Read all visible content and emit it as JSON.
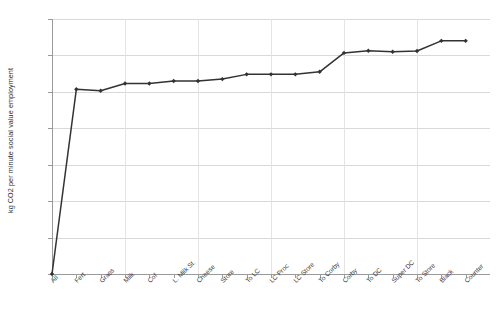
{
  "chart_data": {
    "type": "line",
    "title": "",
    "xlabel": "",
    "ylabel": "kg CO2 per minute social value employment",
    "ylim": [
      0,
      70
    ],
    "yticks": [
      0,
      10,
      20,
      30,
      40,
      50,
      60,
      70
    ],
    "grid": true,
    "legend": "none",
    "marker": "diamond",
    "line_color": "#333333",
    "marker_color": "#333333",
    "categories": [
      "All",
      "Fert",
      "Grass",
      "Milk",
      "Cof",
      "L. Milk St.",
      "Cheese",
      "Store",
      "To LC",
      "LC Proc",
      "LC Store",
      "To Corby",
      "Corby",
      "To DC",
      "Super DC",
      "To Store",
      "Black",
      "Counter"
    ],
    "values": [
      0,
      50.7,
      50.3,
      52.3,
      52.3,
      53.0,
      53.0,
      53.5,
      54.8,
      54.8,
      54.8,
      55.5,
      60.7,
      61.3,
      61.0,
      61.2,
      64.0,
      64.0
    ]
  },
  "colors": {
    "line": "#333333",
    "grid": "#d9d9d9",
    "axis": "#9a9a9a",
    "text": "#2b2b2b",
    "background": "#ffffff"
  }
}
